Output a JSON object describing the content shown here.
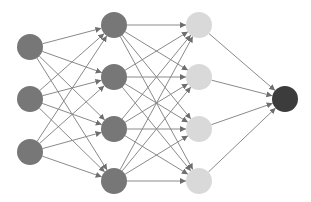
{
  "diagram": {
    "type": "neural-network",
    "width": 311,
    "height": 202,
    "node_radius": 13,
    "edge_color": "#8a8a8a",
    "edge_width": 1,
    "layers": [
      {
        "name": "input",
        "x": 30,
        "color": "#777777",
        "nodes": [
          47,
          99,
          152
        ]
      },
      {
        "name": "hidden-1",
        "x": 114,
        "color": "#777777",
        "nodes": [
          25,
          77,
          129,
          181
        ]
      },
      {
        "name": "hidden-2",
        "x": 199,
        "color": "#d9d9d9",
        "nodes": [
          25,
          77,
          129,
          181
        ]
      },
      {
        "name": "output",
        "x": 285,
        "color": "#3c3c3c",
        "nodes": [
          99
        ]
      }
    ]
  }
}
